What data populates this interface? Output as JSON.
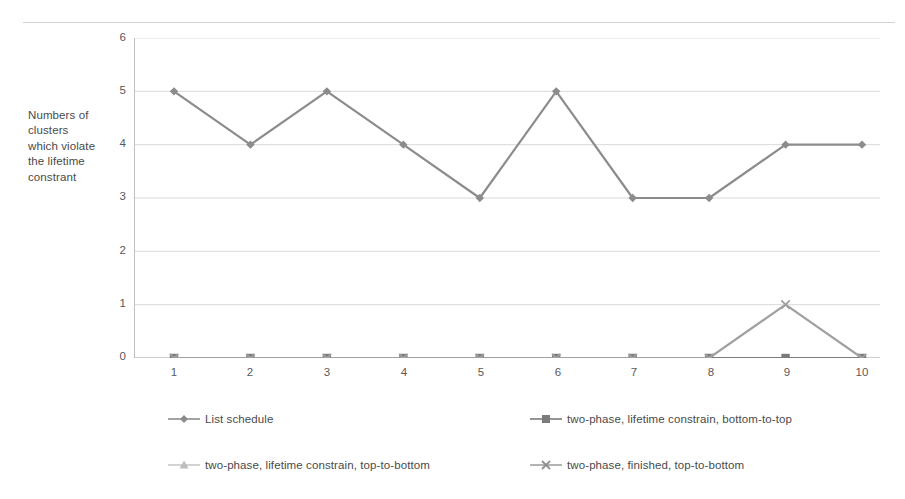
{
  "chart_data": {
    "type": "line",
    "title": "",
    "subtitle": "",
    "xlabel": "",
    "ylabel": "Numbers of clusters which violate the lifetime constrant",
    "ylabel_lines": [
      "Numbers of",
      "clusters",
      "which violate",
      "the lifetime",
      "constrant"
    ],
    "categories": [
      "1",
      "2",
      "3",
      "4",
      "5",
      "6",
      "7",
      "8",
      "9",
      "10"
    ],
    "x": [
      1,
      2,
      3,
      4,
      5,
      6,
      7,
      8,
      9,
      10
    ],
    "ylim": [
      0,
      6
    ],
    "xlim": [
      1,
      10
    ],
    "yticks": [
      "6",
      "5",
      "4",
      "3",
      "2",
      "1",
      "0"
    ],
    "ytick_values": [
      6,
      5,
      4,
      3,
      2,
      1,
      0
    ],
    "grid": "horizontal",
    "legend_position": "bottom",
    "series": [
      {
        "name": "List schedule",
        "values": [
          5,
          4,
          5,
          4,
          3,
          5,
          3,
          3,
          4,
          4
        ],
        "marker": "diamond",
        "color": "#8c8c8c"
      },
      {
        "name": "two-phase, lifetime constrain, bottom-to-top",
        "values": [
          0,
          0,
          0,
          0,
          0,
          0,
          0,
          0,
          0,
          0
        ],
        "marker": "square",
        "color": "#7b7b7b"
      },
      {
        "name": "two-phase, lifetime constrain, top-to-bottom",
        "values": [
          0,
          0,
          0,
          0,
          0,
          0,
          0,
          0,
          0,
          0
        ],
        "marker": "triangle",
        "color": "#bdbdbd"
      },
      {
        "name": "two-phase, finished, top-to-bottom",
        "values": [
          0,
          0,
          0,
          0,
          0,
          0,
          0,
          0,
          1,
          0
        ],
        "marker": "cross",
        "color": "#a0a0a0"
      }
    ]
  },
  "axis": {
    "y_ticks": [
      {
        "label": "6",
        "value": 6
      },
      {
        "label": "5",
        "value": 5
      },
      {
        "label": "4",
        "value": 4
      },
      {
        "label": "3",
        "value": 3
      },
      {
        "label": "2",
        "value": 2
      },
      {
        "label": "1",
        "value": 1
      },
      {
        "label": "0",
        "value": 0
      }
    ],
    "x_ticks": [
      {
        "label": "1"
      },
      {
        "label": "2"
      },
      {
        "label": "3"
      },
      {
        "label": "4"
      },
      {
        "label": "5"
      },
      {
        "label": "6"
      },
      {
        "label": "7"
      },
      {
        "label": "8"
      },
      {
        "label": "9"
      },
      {
        "label": "10"
      }
    ]
  },
  "legend": {
    "items": [
      {
        "label": "List schedule",
        "marker": "diamond",
        "color": "#8c8c8c"
      },
      {
        "label": "two-phase, lifetime constrain, bottom-to-top",
        "marker": "square",
        "color": "#7b7b7b"
      },
      {
        "label": "two-phase, lifetime constrain, top-to-bottom",
        "marker": "triangle",
        "color": "#bdbdbd"
      },
      {
        "label": "two-phase, finished, top-to-bottom",
        "marker": "cross",
        "color": "#a0a0a0"
      }
    ]
  },
  "colors": {
    "grid": "#d9d9d9",
    "axis": "#bfbfbf",
    "text": "#595959",
    "background": "#ffffff"
  }
}
